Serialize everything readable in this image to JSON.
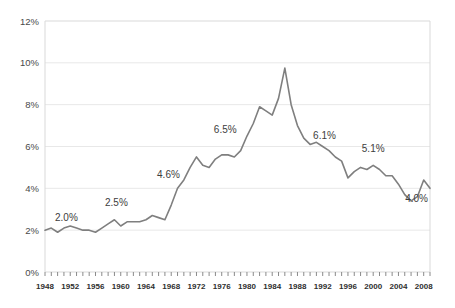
{
  "chart_data": {
    "type": "line",
    "title": "",
    "subtitle": "",
    "xlabel": "",
    "ylabel": "",
    "xlim": [
      1948,
      2009
    ],
    "ylim": [
      0,
      12
    ],
    "grid": true,
    "legend": "none",
    "y_ticks": [
      "0%",
      "2%",
      "4%",
      "6%",
      "8%",
      "10%",
      "12%"
    ],
    "y_tick_values": [
      0,
      2,
      4,
      6,
      8,
      10,
      12
    ],
    "x_ticks": [
      "1948",
      "1952",
      "1956",
      "1960",
      "1964",
      "1968",
      "1972",
      "1976",
      "1980",
      "1984",
      "1988",
      "1992",
      "1996",
      "2000",
      "2004",
      "2008"
    ],
    "x_tick_values": [
      1948,
      1952,
      1956,
      1960,
      1964,
      1968,
      1972,
      1976,
      1980,
      1984,
      1988,
      1992,
      1996,
      2000,
      2004,
      2008
    ],
    "series": [
      {
        "name": "rate",
        "color": "#7f7f7f",
        "x": [
          1948,
          1949,
          1950,
          1951,
          1952,
          1953,
          1954,
          1955,
          1956,
          1957,
          1958,
          1959,
          1960,
          1961,
          1962,
          1963,
          1964,
          1965,
          1966,
          1967,
          1968,
          1969,
          1970,
          1971,
          1972,
          1973,
          1974,
          1975,
          1976,
          1977,
          1978,
          1979,
          1980,
          1981,
          1982,
          1983,
          1984,
          1985,
          1986,
          1987,
          1988,
          1989,
          1990,
          1991,
          1992,
          1993,
          1994,
          1995,
          1996,
          1997,
          1998,
          1999,
          2000,
          2001,
          2002,
          2003,
          2004,
          2005,
          2006,
          2007,
          2008,
          2009
        ],
        "values": [
          2.0,
          2.1,
          1.9,
          2.1,
          2.2,
          2.1,
          2.0,
          2.0,
          1.9,
          2.1,
          2.3,
          2.5,
          2.2,
          2.4,
          2.4,
          2.4,
          2.5,
          2.7,
          2.6,
          2.5,
          3.2,
          4.0,
          4.4,
          5.0,
          5.5,
          5.1,
          5.0,
          5.4,
          5.6,
          5.6,
          5.5,
          5.8,
          6.5,
          7.1,
          7.9,
          7.7,
          7.5,
          8.3,
          9.75,
          8.0,
          7.0,
          6.4,
          6.1,
          6.2,
          6.0,
          5.8,
          5.5,
          5.3,
          4.5,
          4.8,
          5.0,
          4.9,
          5.1,
          4.9,
          4.6,
          4.6,
          4.2,
          3.7,
          3.4,
          3.6,
          4.4,
          4.0
        ],
        "annotations": [
          {
            "label": "2.0%",
            "x": 1948,
            "y": 2.0
          },
          {
            "label": "2.5%",
            "x": 1959,
            "y": 2.5
          },
          {
            "label": "4.6%",
            "x": 1970,
            "y": 4.4
          },
          {
            "label": "6.5%",
            "x": 1979,
            "y": 6.5
          },
          {
            "label": "6.1%",
            "x": 1990,
            "y": 6.1
          },
          {
            "label": "5.1%",
            "x": 2000,
            "y": 5.1
          },
          {
            "label": "4.0%",
            "x": 2009,
            "y": 4.0
          }
        ]
      }
    ],
    "annotation_labels": [
      "2.0%",
      "2.5%",
      "4.6%",
      "6.5%",
      "6.1%",
      "5.1%",
      "4.0%"
    ],
    "colors": {
      "line": "#7f7f7f",
      "grid": "#e8e8e8",
      "border": "#d9d9d9",
      "axis_text": "#4a4a4a",
      "background": "#ffffff"
    }
  }
}
